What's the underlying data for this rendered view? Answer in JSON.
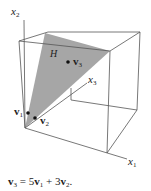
{
  "figure": {
    "axes": {
      "x1": {
        "label": "x",
        "sub": "1"
      },
      "x2": {
        "label": "x",
        "sub": "2"
      },
      "x3": {
        "label": "x",
        "sub": "3"
      }
    },
    "plane_label": "H",
    "points": [
      {
        "name": "v",
        "sub": "1"
      },
      {
        "name": "v",
        "sub": "2"
      },
      {
        "name": "v",
        "sub": "3"
      }
    ],
    "colors": {
      "plane_fill": "#a6a6a6",
      "lines": "#555555",
      "points": "#111111"
    }
  },
  "caption": {
    "lhs": "v",
    "lhs_sub": "3",
    "eq": " = 5",
    "t1": "v",
    "t1_sub": "1",
    "plus": " + 3",
    "t2": "v",
    "t2_sub": "2",
    "end": "."
  }
}
